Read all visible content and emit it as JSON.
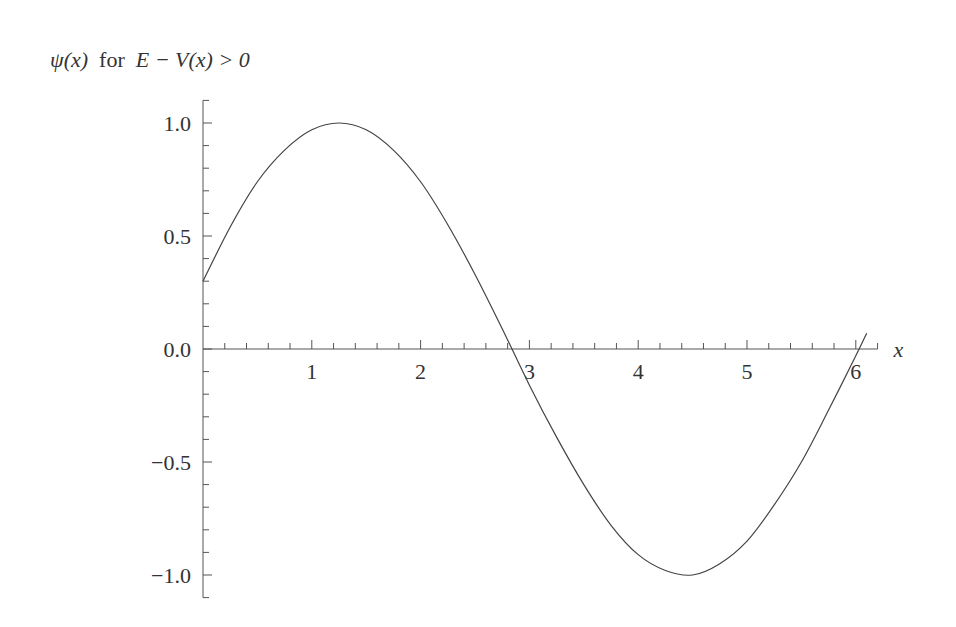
{
  "chart_data": {
    "type": "line",
    "xlabel": "x",
    "ylabel": "",
    "xlim": [
      0,
      6.2
    ],
    "ylim": [
      -1.1,
      1.1
    ],
    "grid": false,
    "x_ticks": [
      1,
      2,
      3,
      4,
      5,
      6
    ],
    "x_tick_labels": [
      "1",
      "2",
      "3",
      "4",
      "5",
      "6"
    ],
    "y_ticks": [
      1.0,
      0.5,
      0.0,
      -0.5,
      -1.0
    ],
    "y_tick_labels": [
      "1.0",
      "0.5",
      "0.0",
      "−0.5",
      "−1.0"
    ],
    "series": [
      {
        "name": "ψ(x)",
        "x": [
          0,
          0.25,
          0.5,
          0.75,
          1.0,
          1.25,
          1.5,
          1.75,
          2.0,
          2.25,
          2.5,
          2.75,
          3.0,
          3.25,
          3.5,
          3.75,
          4.0,
          4.25,
          4.5,
          4.75,
          5.0,
          5.25,
          5.5,
          5.75,
          6.0,
          6.1
        ],
        "values": [
          0.3,
          0.54,
          0.74,
          0.88,
          0.97,
          1.0,
          0.97,
          0.88,
          0.74,
          0.55,
          0.33,
          0.09,
          -0.16,
          -0.39,
          -0.6,
          -0.78,
          -0.91,
          -0.98,
          -1.0,
          -0.95,
          -0.85,
          -0.69,
          -0.5,
          -0.27,
          -0.03,
          0.07
        ]
      }
    ]
  },
  "title": {
    "psi": "ψ(x)",
    "for": "for",
    "condition": "E − V(x) > 0"
  }
}
